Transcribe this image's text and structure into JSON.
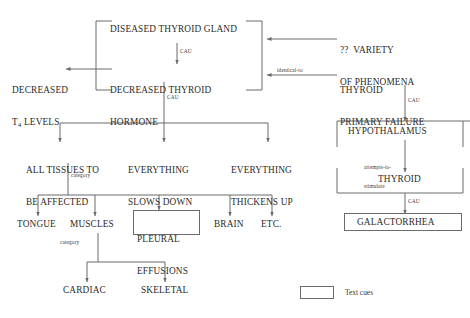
{
  "diagram": {
    "line_color": "#6b6b6b",
    "text_color": "#2b2b2b",
    "background": "#ffffff",
    "nodes": {
      "diseased_thyroid_gland": "DISEASED THYROID GLAND",
      "decreased_thyroid_hormone_l1": "DECREASED THYROID",
      "decreased_thyroid_hormone_l2": "HORMONE",
      "decreased_t4_l1": "DECREASED",
      "decreased_t4_l2_pre": "T",
      "decreased_t4_l2_sub": "4",
      "decreased_t4_l2_post": " LEVELS",
      "variety_of_phenomena_l1": "??  VARIETY",
      "variety_of_phenomena_l2": "OF PHENOMENA",
      "thyroid_primary_failure_l1": "THYROID",
      "thyroid_primary_failure_l2": "PRIMARY FAILURE",
      "hypothalamus": "HYPOTHALAMUS",
      "thyroid": "THYROID",
      "galactorrhea": "GALACTORRHEA",
      "all_tissues_l1": "ALL TISSUES TO",
      "all_tissues_l2": "BE AFFECTED",
      "everything_slows_l1": "EVERYTHING",
      "everything_slows_l2": "SLOWS DOWN",
      "everything_thickens_l1": "EVERYTHING",
      "everything_thickens_l2": "THICKENS UP",
      "tongue": "TONGUE",
      "muscles": "MUSCLES",
      "pleural_effusions_l1": "PLEURAL",
      "pleural_effusions_l2": "EFFUSIONS",
      "brain": "BRAIN",
      "etc": "ETC.",
      "cardiac": "CARDIAC",
      "skeletal": "SKELETAL"
    },
    "edge_labels": {
      "cau_gland_to_hormone": "CAU",
      "cau_hormone_to_effects": "CAU",
      "cau_failure_to_hypothalamus": "CAU",
      "cau_thyroid_to_galactorrhea": "CAU",
      "identical_to": "identical-to",
      "attempts_to_stimulate_l1": "attempts-to-",
      "attempts_to_stimulate_l2": "stimulate",
      "category_tissues": "category",
      "category_muscles": "category"
    },
    "legend": {
      "swatch_meaning": "Text cues"
    }
  }
}
